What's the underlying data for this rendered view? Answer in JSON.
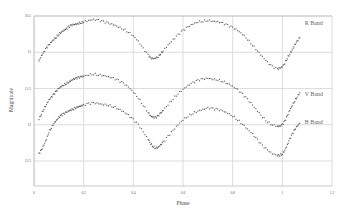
{
  "chart_data": {
    "type": "scatter",
    "title": "",
    "xlabel": "Phase",
    "ylabel": "Magnitude",
    "xlim": [
      0,
      1.2
    ],
    "ylim": [
      10.5,
      12.85
    ],
    "y_inverted": true,
    "grid": true,
    "x_ticks": [
      "0",
      "0.2",
      "0.4",
      "0.6",
      "0.8",
      "1",
      "1.2"
    ],
    "y_ticks": [
      "10.5",
      "11",
      "11.5",
      "12",
      "12.5"
    ],
    "series": [
      {
        "name": "R Band",
        "label_pos": [
          1.09,
          10.63
        ],
        "x": [
          0.02,
          0.03,
          0.04,
          0.05,
          0.06,
          0.07,
          0.08,
          0.09,
          0.1,
          0.11,
          0.12,
          0.13,
          0.14,
          0.15,
          0.16,
          0.17,
          0.18,
          0.19,
          0.2,
          0.22,
          0.24,
          0.26,
          0.28,
          0.3,
          0.32,
          0.34,
          0.36,
          0.38,
          0.4,
          0.42,
          0.44,
          0.46,
          0.47,
          0.48,
          0.49,
          0.5,
          0.51,
          0.52,
          0.54,
          0.56,
          0.58,
          0.6,
          0.62,
          0.64,
          0.66,
          0.68,
          0.7,
          0.72,
          0.74,
          0.76,
          0.78,
          0.8,
          0.82,
          0.84,
          0.86,
          0.88,
          0.9,
          0.92,
          0.94,
          0.96,
          0.98,
          0.99,
          1.0,
          1.01,
          1.02,
          1.03,
          1.04,
          1.05,
          1.06,
          1.07
        ],
        "values": [
          11.12,
          11.05,
          11.0,
          10.94,
          10.9,
          10.86,
          10.82,
          10.79,
          10.75,
          10.72,
          10.7,
          10.68,
          10.65,
          10.63,
          10.62,
          10.61,
          10.6,
          10.59,
          10.58,
          10.56,
          10.55,
          10.56,
          10.58,
          10.6,
          10.62,
          10.65,
          10.68,
          10.72,
          10.77,
          10.85,
          10.95,
          11.04,
          11.08,
          11.09,
          11.08,
          11.06,
          11.02,
          10.98,
          10.9,
          10.83,
          10.76,
          10.7,
          10.65,
          10.61,
          10.58,
          10.57,
          10.56,
          10.57,
          10.58,
          10.6,
          10.63,
          10.66,
          10.7,
          10.75,
          10.82,
          10.9,
          10.98,
          11.06,
          11.14,
          11.2,
          11.23,
          11.22,
          11.2,
          11.15,
          11.08,
          11.02,
          10.97,
          10.9,
          10.85,
          10.8
        ]
      },
      {
        "name": "V Band",
        "label_pos": [
          1.09,
          11.61
        ],
        "x": [
          0.02,
          0.03,
          0.04,
          0.05,
          0.06,
          0.07,
          0.08,
          0.09,
          0.1,
          0.11,
          0.12,
          0.13,
          0.14,
          0.15,
          0.16,
          0.17,
          0.18,
          0.19,
          0.2,
          0.22,
          0.24,
          0.26,
          0.28,
          0.3,
          0.32,
          0.34,
          0.36,
          0.38,
          0.4,
          0.42,
          0.44,
          0.46,
          0.47,
          0.48,
          0.49,
          0.5,
          0.51,
          0.52,
          0.54,
          0.56,
          0.58,
          0.6,
          0.62,
          0.64,
          0.66,
          0.68,
          0.7,
          0.72,
          0.74,
          0.76,
          0.78,
          0.8,
          0.82,
          0.84,
          0.86,
          0.88,
          0.9,
          0.92,
          0.94,
          0.96,
          0.98,
          0.99,
          1.0,
          1.01,
          1.02,
          1.03,
          1.04,
          1.05,
          1.06,
          1.07
        ],
        "values": [
          11.92,
          11.85,
          11.78,
          11.72,
          11.66,
          11.62,
          11.58,
          11.54,
          11.5,
          11.47,
          11.45,
          11.43,
          11.41,
          11.39,
          11.37,
          11.36,
          11.35,
          11.34,
          11.33,
          11.31,
          11.3,
          11.31,
          11.32,
          11.34,
          11.36,
          11.39,
          11.43,
          11.48,
          11.55,
          11.63,
          11.73,
          11.83,
          11.88,
          11.9,
          11.9,
          11.88,
          11.84,
          11.8,
          11.72,
          11.64,
          11.57,
          11.51,
          11.46,
          11.42,
          11.39,
          11.37,
          11.36,
          11.37,
          11.38,
          11.4,
          11.43,
          11.47,
          11.52,
          11.58,
          11.65,
          11.73,
          11.81,
          11.89,
          11.96,
          12.0,
          12.02,
          12.02,
          12.0,
          11.95,
          11.88,
          11.8,
          11.73,
          11.67,
          11.61,
          11.56
        ]
      },
      {
        "name": "B Band",
        "label_pos": [
          1.09,
          11.99
        ],
        "x": [
          0.02,
          0.03,
          0.04,
          0.05,
          0.06,
          0.07,
          0.08,
          0.09,
          0.1,
          0.11,
          0.12,
          0.13,
          0.14,
          0.15,
          0.16,
          0.17,
          0.18,
          0.19,
          0.2,
          0.22,
          0.24,
          0.26,
          0.28,
          0.3,
          0.32,
          0.34,
          0.36,
          0.38,
          0.4,
          0.42,
          0.44,
          0.46,
          0.47,
          0.48,
          0.49,
          0.5,
          0.51,
          0.52,
          0.54,
          0.56,
          0.58,
          0.6,
          0.62,
          0.64,
          0.66,
          0.68,
          0.7,
          0.72,
          0.74,
          0.76,
          0.78,
          0.8,
          0.82,
          0.84,
          0.86,
          0.88,
          0.9,
          0.92,
          0.94,
          0.96,
          0.98,
          0.99,
          1.0,
          1.01,
          1.02,
          1.03,
          1.04,
          1.05,
          1.06,
          1.07
        ],
        "values": [
          12.4,
          12.35,
          12.28,
          12.2,
          12.1,
          12.04,
          11.98,
          11.94,
          11.9,
          11.87,
          11.85,
          11.83,
          11.81,
          11.79,
          11.78,
          11.76,
          11.75,
          11.74,
          11.73,
          11.71,
          11.7,
          11.71,
          11.72,
          11.73,
          11.75,
          11.78,
          11.82,
          11.87,
          11.93,
          12.0,
          12.1,
          12.2,
          12.26,
          12.3,
          12.32,
          12.31,
          12.28,
          12.24,
          12.16,
          12.08,
          12.0,
          11.93,
          11.88,
          11.84,
          11.81,
          11.79,
          11.77,
          11.78,
          11.79,
          11.81,
          11.84,
          11.88,
          11.93,
          11.99,
          12.06,
          12.13,
          12.21,
          12.29,
          12.35,
          12.4,
          12.42,
          12.42,
          12.4,
          12.35,
          12.28,
          12.2,
          12.13,
          12.07,
          12.02,
          11.98
        ]
      }
    ],
    "legend_position": "inline-right"
  },
  "labels": {
    "xlabel": "Phase",
    "ylabel": "Magnitude"
  }
}
